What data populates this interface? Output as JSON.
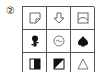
{
  "question": {
    "number_label": "②"
  },
  "grid": {
    "rows": 3,
    "cols": 3,
    "cells": [
      {
        "row": 1,
        "col": 1,
        "icon": "folded-corner-square-icon"
      },
      {
        "row": 1,
        "col": 2,
        "icon": "down-arrow-outline-icon"
      },
      {
        "row": 1,
        "col": 3,
        "icon": "square-with-arc-icon"
      },
      {
        "row": 2,
        "col": 1,
        "icon": "keyhole-key-filled-icon"
      },
      {
        "row": 2,
        "col": 2,
        "icon": "circle-wavy-face-icon"
      },
      {
        "row": 2,
        "col": 3,
        "icon": "spade-filled-icon"
      },
      {
        "row": 3,
        "col": 1,
        "icon": "half-filled-square-vertical-icon"
      },
      {
        "row": 3,
        "col": 2,
        "icon": "diagonal-half-filled-square-icon"
      },
      {
        "row": 3,
        "col": 3,
        "icon": "triangle-outline-icon"
      }
    ]
  }
}
